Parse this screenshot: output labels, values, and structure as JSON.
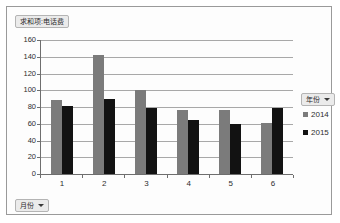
{
  "chart_data": {
    "type": "bar",
    "title": "求和项:电话费",
    "xlabel": "月份",
    "ylabel": "",
    "categories": [
      "1",
      "2",
      "3",
      "4",
      "5",
      "6"
    ],
    "series": [
      {
        "name": "2014",
        "color": "#7b7b7b",
        "values": [
          88,
          142,
          100,
          76,
          77,
          61
        ]
      },
      {
        "name": "2015",
        "color": "#121212",
        "values": [
          81,
          90,
          79,
          65,
          60,
          79
        ]
      }
    ],
    "ylim": [
      0,
      160
    ],
    "ytick_step": 20,
    "yticks": [
      "160",
      "140",
      "120",
      "100",
      "80",
      "60",
      "40",
      "20",
      "0"
    ],
    "grid": true,
    "legend_position": "right"
  },
  "value_field_button": {
    "label": "求和项:电话费"
  },
  "row_field_button": {
    "label": "月份",
    "caret": "dropdown-caret"
  },
  "legend_field_button": {
    "label": "年份",
    "caret": "dropdown-caret"
  }
}
